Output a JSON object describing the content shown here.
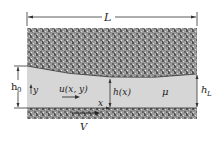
{
  "diagram": {
    "labels": {
      "length": "L",
      "h0_base": "h",
      "h0_sub": "0",
      "hL_base": "h",
      "hL_sub": "L",
      "hx": "h(x)",
      "velocity_field": "u(x, y)",
      "viscosity": "μ",
      "x_axis": "x",
      "y_axis": "y",
      "wall_velocity": "V"
    },
    "colors": {
      "fluid": "#d6d6d6",
      "solid": "#8a8a8a",
      "line": "#333333"
    }
  }
}
